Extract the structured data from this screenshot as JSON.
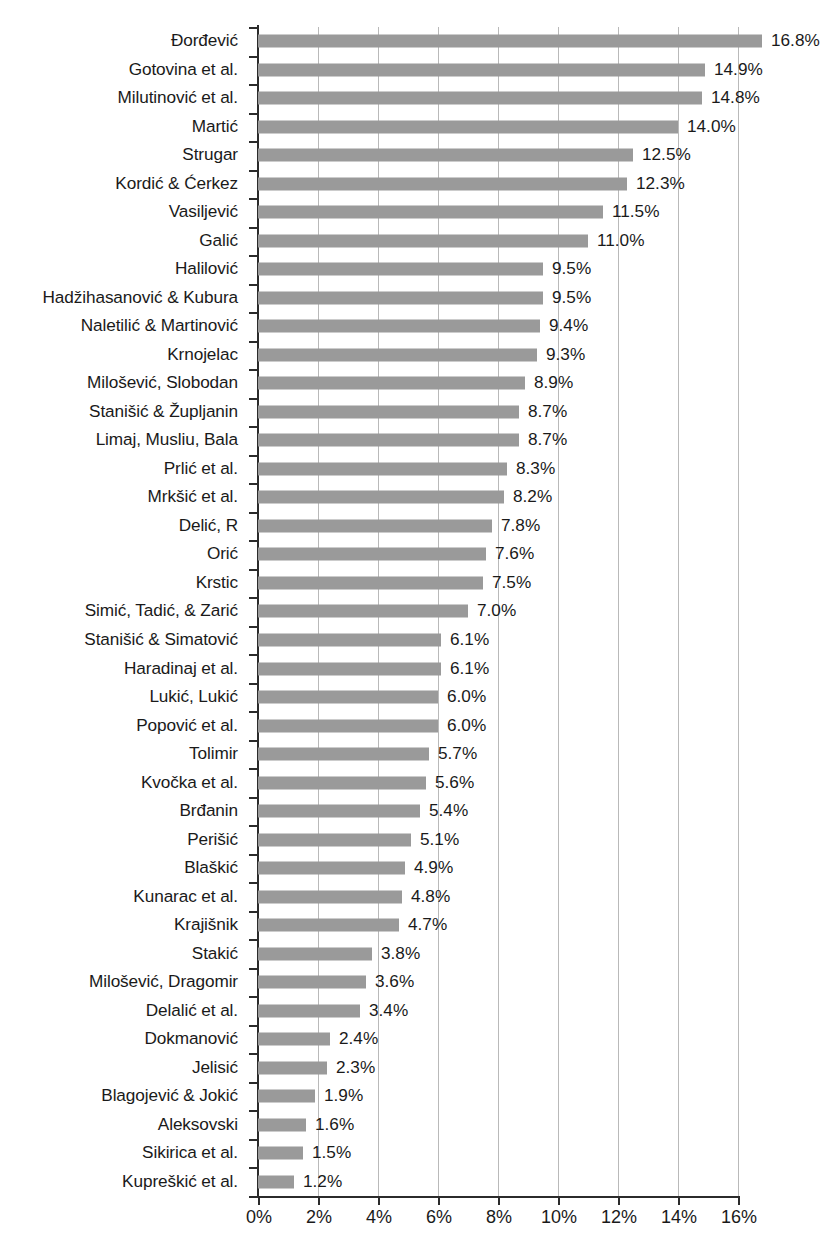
{
  "chart_data": {
    "type": "bar",
    "orientation": "horizontal",
    "title": "",
    "subtitle": "",
    "xlabel": "",
    "ylabel": "",
    "xlim": [
      0,
      16
    ],
    "xticks": [
      0,
      2,
      4,
      6,
      8,
      10,
      12,
      14,
      16
    ],
    "xtick_labels": [
      "0%",
      "2%",
      "4%",
      "6%",
      "8%",
      "10%",
      "12%",
      "14%",
      "16%"
    ],
    "grid": "vertical",
    "legend": "none",
    "value_label_suffix": "%",
    "bar_color": "#9a9a9a",
    "axis_color": "#2b2b2b",
    "gridline_color": "#b9b9b9",
    "categories": [
      "Đorđević",
      "Gotovina et al.",
      "Milutinović et al.",
      "Martić",
      "Strugar",
      "Kordić & Ćerkez",
      "Vasiljević",
      "Galić",
      "Halilović",
      "Hadžihasanović & Kubura",
      "Naletilić & Martinović",
      "Krnojelac",
      "Milošević, Slobodan",
      "Stanišić & Župljanin",
      "Limaj, Musliu, Bala",
      "Prlić et al.",
      "Mrkšić et al.",
      "Delić, R",
      "Orić",
      "Krstic",
      "Simić, Tadić, & Zarić",
      "Stanišić & Simatović",
      "Haradinaj et al.",
      "Lukić, Lukić",
      "Popović et al.",
      "Tolimir",
      "Kvočka et al.",
      "Brđanin",
      "Perišić",
      "Blaškić",
      "Kunarac et al.",
      "Krajišnik",
      "Stakić",
      "Milošević, Dragomir",
      "Delalić et al.",
      "Dokmanović",
      "Jelisić",
      "Blagojević & Jokić",
      "Aleksovski",
      "Sikirica et al.",
      "Kupreškić et al."
    ],
    "values": [
      16.8,
      14.9,
      14.8,
      14.0,
      12.5,
      12.3,
      11.5,
      11.0,
      9.5,
      9.5,
      9.4,
      9.3,
      8.9,
      8.7,
      8.7,
      8.3,
      8.2,
      7.8,
      7.6,
      7.5,
      7.0,
      6.1,
      6.1,
      6.0,
      6.0,
      5.7,
      5.6,
      5.4,
      5.1,
      4.9,
      4.8,
      4.7,
      3.8,
      3.6,
      3.4,
      2.4,
      2.3,
      1.9,
      1.6,
      1.5,
      1.2
    ],
    "value_labels": [
      "16.8%",
      "14.9%",
      "14.8%",
      "14.0%",
      "12.5%",
      "12.3%",
      "11.5%",
      "11.0%",
      "9.5%",
      "9.5%",
      "9.4%",
      "9.3%",
      "8.9%",
      "8.7%",
      "8.7%",
      "8.3%",
      "8.2%",
      "7.8%",
      "7.6%",
      "7.5%",
      "7.0%",
      "6.1%",
      "6.1%",
      "6.0%",
      "6.0%",
      "5.7%",
      "5.6%",
      "5.4%",
      "5.1%",
      "4.9%",
      "4.8%",
      "4.7%",
      "3.8%",
      "3.6%",
      "3.4%",
      "2.4%",
      "2.3%",
      "1.9%",
      "1.6%",
      "1.5%",
      "1.2%"
    ]
  }
}
